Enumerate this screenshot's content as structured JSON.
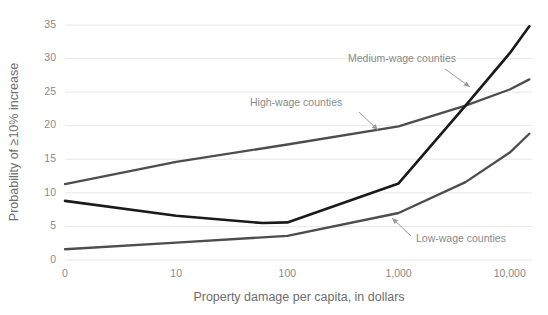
{
  "chart_data": {
    "type": "line",
    "title": "",
    "subtitle": "",
    "xlabel": "Property damage per capita, in dollars",
    "ylabel": "Probability of ≥10% increase",
    "x_scale": "log-like",
    "x_ticks": [
      "0",
      "10",
      "100",
      "1,000",
      "10,000"
    ],
    "x_tick_values": [
      0,
      10,
      100,
      1000,
      10000
    ],
    "y_ticks": [
      "0",
      "5",
      "10",
      "15",
      "20",
      "25",
      "30",
      "35"
    ],
    "y_tick_values": [
      0,
      5,
      10,
      15,
      20,
      25,
      30,
      35
    ],
    "ylim": [
      0,
      35
    ],
    "grid": "horizontal",
    "legend": "inline-annotations",
    "series": [
      {
        "name": "High-wage counties",
        "color": "#4d4d4d",
        "width": 2.3,
        "x": [
          0,
          10,
          100,
          1000,
          4000,
          10000,
          15000
        ],
        "values": [
          11.3,
          14.6,
          17.2,
          19.9,
          23.0,
          25.4,
          26.9
        ]
      },
      {
        "name": "Medium-wage counties",
        "color": "#1a1a1a",
        "width": 2.6,
        "x": [
          0,
          10,
          60,
          100,
          1000,
          4000,
          10000,
          15000
        ],
        "values": [
          8.8,
          6.6,
          5.5,
          5.6,
          11.4,
          23.0,
          30.8,
          34.8
        ]
      },
      {
        "name": "Low-wage counties",
        "color": "#4d4d4d",
        "width": 2.3,
        "x": [
          0,
          10,
          100,
          1000,
          4000,
          10000,
          15000
        ],
        "values": [
          1.6,
          2.6,
          3.6,
          7.0,
          11.6,
          16.0,
          18.8
        ]
      }
    ],
    "annotations": [
      {
        "id": "medium-wage-annotation",
        "text": "Medium-wage counties",
        "label_x": 348,
        "label_y": 62,
        "arrow_x1": 445,
        "arrow_y1": 69,
        "arrow_x2": 470,
        "arrow_y2": 87
      },
      {
        "id": "high-wage-annotation",
        "text": "High-wage counties",
        "label_x": 250,
        "label_y": 106,
        "arrow_x1": 359,
        "arrow_y1": 112,
        "arrow_x2": 378,
        "arrow_y2": 130
      },
      {
        "id": "low-wage-annotation",
        "text": "Low-wage counties",
        "label_x": 416,
        "label_y": 242,
        "arrow_x1": 411,
        "arrow_y1": 236,
        "arrow_x2": 392,
        "arrow_y2": 218
      }
    ]
  }
}
